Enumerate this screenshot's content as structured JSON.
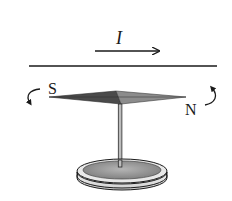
{
  "diagram": {
    "type": "physics-magnetism",
    "wire": {
      "current_label": "I",
      "current_direction": "right"
    },
    "needle": {
      "south_label": "S",
      "north_label": "N",
      "south_rotation": "curves downward / toward viewer",
      "north_rotation": "curves upward / away from viewer"
    },
    "colors": {
      "line": "#1a1a1a",
      "needle_dark": "#4a4a4a",
      "needle_light": "#8c8c8c",
      "base_top": "#9a9a9a",
      "base_side": "#e6e6e6",
      "background": "#ffffff"
    }
  }
}
